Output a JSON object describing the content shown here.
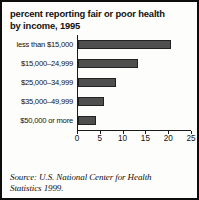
{
  "chart_data": {
    "type": "bar",
    "orientation": "horizontal",
    "title": "percent reporting fair or poor health by income, 1995",
    "title_lines": [
      "percent reporting fair or poor health",
      "by income, 1995"
    ],
    "categories": [
      "less than $15,000",
      "$15,000–24,999",
      "$25,000–34,999",
      "$35,000–49,999",
      "$50,000 or more"
    ],
    "values": [
      20.5,
      13.2,
      8.4,
      5.7,
      4.0
    ],
    "xlabel": "",
    "ylabel": "",
    "xlim": [
      0,
      25
    ],
    "xticks": [
      0,
      5,
      10,
      15,
      20,
      25
    ],
    "xticklabels": [
      "0",
      "5",
      "10",
      "15",
      "20",
      "25"
    ],
    "grid": false,
    "legend": false,
    "bar_color": "#4f4f4f",
    "bar_edge_color": "#222222",
    "axis_color": "#1a1a1a",
    "background": "#fdfdfb",
    "border_color": "#0d0d0d",
    "source_lines": [
      "Source: U.S. National Center for Health",
      "Statistics 1999."
    ],
    "source": "Source: U.S. National Center for Health Statistics 1999."
  }
}
